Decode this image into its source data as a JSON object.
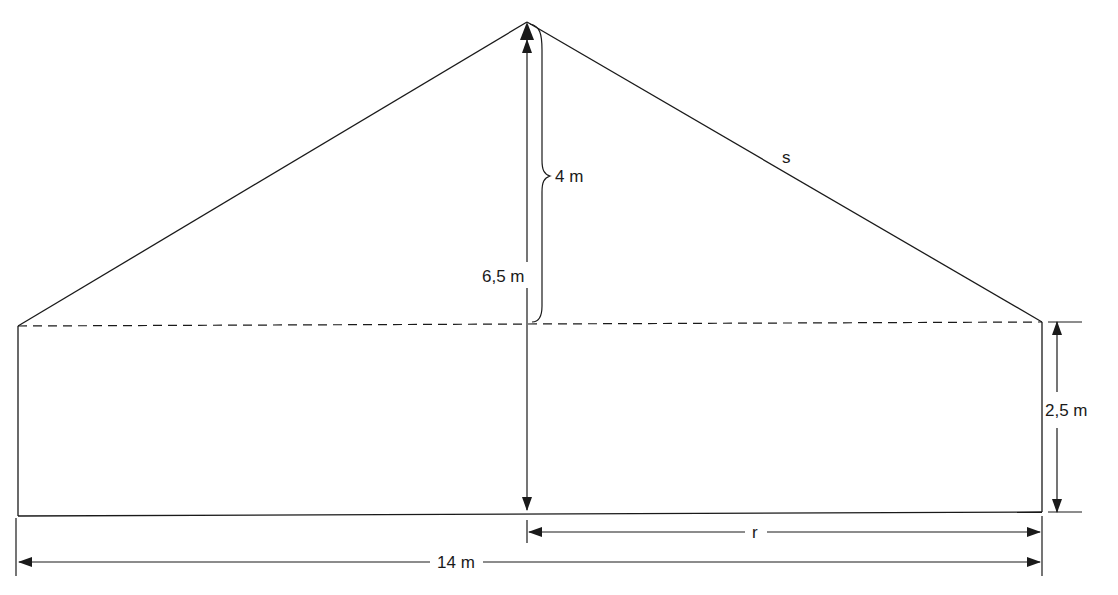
{
  "figure": {
    "type": "house-cross-section",
    "colors": {
      "stroke": "#1a1a1a",
      "background": "#ffffff"
    },
    "labels": {
      "roof_height": "4 m",
      "total_height": "6,5 m",
      "wall_height": "2,5 m",
      "slant": "s",
      "half_width": "r",
      "total_width": "14 m"
    },
    "dimensions": {
      "total_width_m": 14,
      "total_height_m": 6.5,
      "roof_height_m": 4,
      "wall_height_m": 2.5,
      "unknowns": [
        "s",
        "r"
      ]
    }
  }
}
